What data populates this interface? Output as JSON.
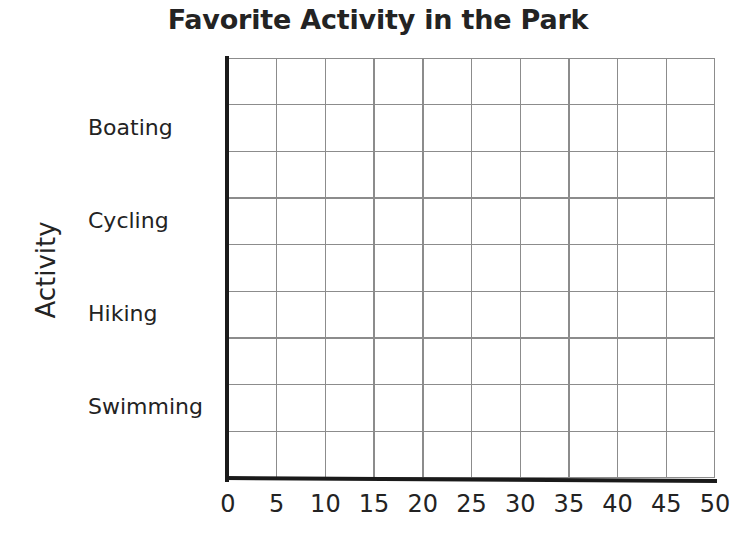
{
  "chart_data": {
    "type": "bar",
    "orientation": "horizontal",
    "title": "Favorite Activity in the Park",
    "xlabel": "",
    "ylabel": "Activity",
    "categories": [
      "Boating",
      "Cycling",
      "Hiking",
      "Swimming"
    ],
    "values": [
      null,
      null,
      null,
      null
    ],
    "series": [
      {
        "name": "",
        "values": [
          null,
          null,
          null,
          null
        ]
      }
    ],
    "xlim": [
      0,
      50
    ],
    "x_ticks": [
      0,
      5,
      10,
      15,
      20,
      25,
      30,
      35,
      40,
      45,
      50
    ],
    "x_tick_labels": [
      "0",
      "5",
      "10",
      "15",
      "20",
      "25",
      "30",
      "35",
      "40",
      "45",
      "50"
    ],
    "grid": true,
    "grid_columns": 10,
    "grid_rows": 9,
    "legend": null,
    "annotations": [],
    "note": "Blank worksheet grid — no bars are drawn for any category"
  },
  "colors": {
    "gridline": "#8c8c8c",
    "axis": "#1a1a1a",
    "text": "#232323",
    "background": "#ffffff"
  },
  "category_rows": [
    {
      "label": "Boating",
      "center_y": 127
    },
    {
      "label": "Cycling",
      "center_y": 220
    },
    {
      "label": "Hiking",
      "center_y": 313
    },
    {
      "label": "Swimming",
      "center_y": 406
    }
  ]
}
